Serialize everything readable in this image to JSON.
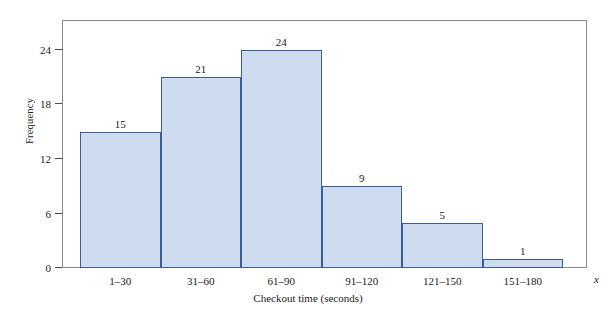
{
  "chart_data": {
    "type": "bar",
    "title": "",
    "subtitle": "",
    "xlabel": "Checkout time (seconds)",
    "ylabel": "Frequency",
    "x_variable_symbol": "x",
    "categories": [
      "1–30",
      "31–60",
      "61–90",
      "91–120",
      "121–150",
      "151–180"
    ],
    "values": [
      15,
      21,
      24,
      9,
      5,
      1
    ],
    "data_labels": [
      "15",
      "21",
      "24",
      "9",
      "5",
      "1"
    ],
    "ylim": [
      0,
      27.3
    ],
    "yticks": [
      0,
      6,
      12,
      18,
      24
    ],
    "ytick_labels": [
      "0",
      "6",
      "12",
      "18",
      "24"
    ],
    "grid": false,
    "legend": false,
    "legend_position": "none",
    "bar_fill_color": "#cfdcef",
    "bar_border_color": "#3a5c9a",
    "frame_color": "#8a8a8a",
    "background_color": "#ffffff",
    "text_color": "#1a1a1a"
  }
}
